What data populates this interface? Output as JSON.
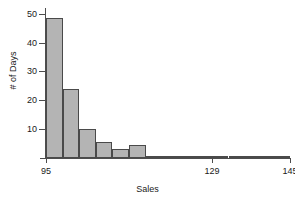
{
  "chart_data": {
    "type": "bar",
    "title": "",
    "subtitle": "",
    "xlabel": "Sales",
    "ylabel": "# of Days",
    "xlim": [
      95,
      145
    ],
    "ylim": [
      0,
      52
    ],
    "grid": false,
    "legend": null,
    "bin_width": 3.4,
    "bin_edges": [
      95,
      98.4,
      101.8,
      105.2,
      108.6,
      112,
      115.4,
      118.8,
      122.2,
      125.6,
      129,
      132.4,
      135.8,
      139.2,
      142.6,
      145
    ],
    "categories": [
      "95-98.4",
      "98.4-101.8",
      "101.8-105.2",
      "105.2-108.6",
      "108.6-112",
      "112-115.4",
      "115.4-118.8",
      "118.8-122.2",
      "122.2-125.6",
      "125.6-129",
      "129-132.4",
      "132.4-135.8",
      "135.8-139.2",
      "139.2-142.6",
      "142.6-145"
    ],
    "values": [
      48.5,
      24,
      10,
      5.5,
      3,
      4.5,
      0.6,
      0.6,
      0.6,
      0.6,
      0.6,
      0.6,
      0.6,
      0.6,
      0.6
    ],
    "x_ticks": [
      95,
      129,
      145
    ],
    "x_tick_labels": [
      "95",
      "129",
      "145"
    ],
    "y_ticks": [
      10,
      20,
      30,
      40,
      50
    ],
    "y_tick_labels": [
      "10",
      "20",
      "30",
      "40",
      "50"
    ],
    "bar_fill_color": "#b4b4b4",
    "bar_edge_color": "#4a4a4a",
    "axis_color": "#4d4d4d",
    "background_color": "#ffffff"
  }
}
